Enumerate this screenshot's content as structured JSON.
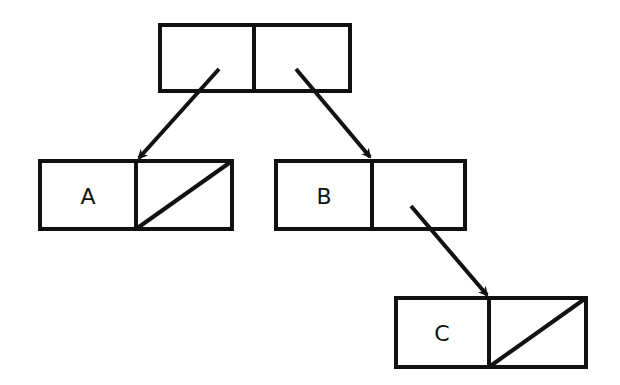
{
  "diagram": {
    "type": "box-and-pointer",
    "nodes": [
      {
        "id": "root",
        "car": "pointer",
        "cdr": "pointer",
        "car_label": "",
        "x": 160,
        "y": 25,
        "w": 190,
        "h": 66
      },
      {
        "id": "a",
        "car_label": "A",
        "cdr": "nil",
        "x": 40,
        "y": 161,
        "w": 192,
        "h": 68
      },
      {
        "id": "b",
        "car_label": "B",
        "cdr": "pointer",
        "x": 276,
        "y": 161,
        "w": 189,
        "h": 68
      },
      {
        "id": "c",
        "car_label": "C",
        "cdr": "nil",
        "x": 396,
        "y": 298,
        "w": 190,
        "h": 69
      }
    ],
    "edges": [
      {
        "from": "root.car",
        "to": "a"
      },
      {
        "from": "root.cdr",
        "to": "b"
      },
      {
        "from": "b.cdr",
        "to": "c"
      }
    ]
  },
  "labels": {
    "a": "A",
    "b": "B",
    "c": "C"
  }
}
